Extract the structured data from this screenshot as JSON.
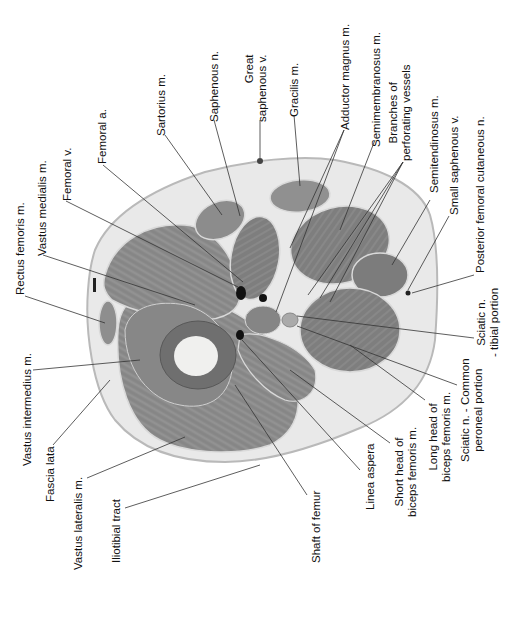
{
  "figure": {
    "labels": {
      "rectus_femoris": "Rectus femoris m.",
      "vastus_medialis": "Vastus medialis m.",
      "femoral_v": "Femoral v.",
      "femoral_a": "Femoral a.",
      "sartorius": "Sartorius m.",
      "saphenous_n": "Saphenous n.",
      "great_saphenous_1": "Great",
      "great_saphenous_2": "saphenous v.",
      "gracilis": "Gracilis m.",
      "adductor_magnus": "Adductor magnus m.",
      "semimembranosus": "Semimembranosus m.",
      "branches_1": "Branches of",
      "branches_2": "perforating vessels",
      "semitendinosus": "Semitendinosus m.",
      "small_saphenous": "Small saphenous v.",
      "post_fem_cut": "Posterior femoral cutaneous n.",
      "sciatic_tibial_1": "Sciatic n.",
      "sciatic_tibial_2": "- tibial portion",
      "sciatic_common_1": "Sciatic n. - Common",
      "sciatic_common_2": "peroneal portion",
      "long_head_1": "Long head of",
      "long_head_2": "biceps femoris m.",
      "short_head_1": "Short head of",
      "short_head_2": "biceps femoris m.",
      "linea_aspera": "Linea aspera",
      "shaft_femur": "Shaft of femur",
      "iliotibial": "Iliotibial tract",
      "vastus_lateralis": "Vastus lateralis m.",
      "fascia_lata": "Fascia lata",
      "vastus_intermedius": "Vastus intermedius m."
    }
  }
}
